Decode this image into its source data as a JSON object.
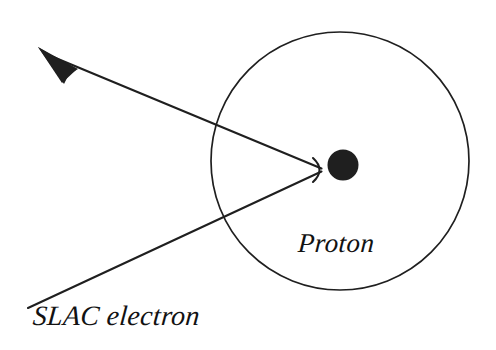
{
  "canvas": {
    "width": 496,
    "height": 350,
    "background_color": "#ffffff",
    "ink_color": "#1a1a1a"
  },
  "diagram": {
    "title_visible": false,
    "type": "physics-scattering-schematic",
    "description_labels": {
      "proton": "Proton",
      "slac_electron": "SLAC electron"
    },
    "shapes": {
      "proton_cloud_circle": {
        "name": "proton-cloud-circle",
        "cx": 340,
        "cy": 161,
        "r": 129,
        "stroke": "#1a1a1a",
        "stroke_width": 1.6,
        "fill": "none"
      },
      "proton_core_dot": {
        "name": "proton-core-dot",
        "cx": 343,
        "cy": 165,
        "r": 15,
        "fill": "#1a1a1a"
      },
      "scatter_vertex": {
        "x": 320,
        "y": 170
      },
      "incoming_path": {
        "name": "incoming-electron-path",
        "from_x": 28,
        "from_y": 308,
        "to_x": 320,
        "to_y": 170,
        "stroke_width": 2.2
      },
      "outgoing_path": {
        "name": "outgoing-electron-path",
        "from_x": 320,
        "from_y": 170,
        "to_x": 48,
        "to_y": 55,
        "stroke_width": 2.2
      },
      "arrow_head": {
        "name": "arrow-head",
        "tip_x": 38,
        "tip_y": 48,
        "length": 36,
        "half_width": 8
      }
    }
  },
  "labels": {
    "proton": {
      "text": "Proton",
      "x": 298,
      "y": 228,
      "font_size": 27
    },
    "slac_electron": {
      "text": "SLAC electron",
      "x": 33,
      "y": 300,
      "font_size": 28
    }
  }
}
